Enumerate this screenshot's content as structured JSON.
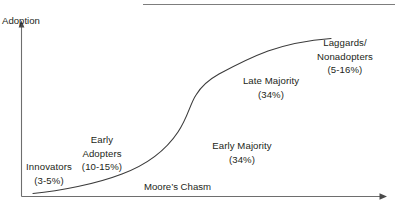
{
  "figure": {
    "type": "diagram",
    "background_color": "#ffffff",
    "line_color": "#3b3b3b",
    "text_color": "#231f20"
  },
  "axes": {
    "y_axis_label": "Adoption",
    "y_axis": {
      "x": 21,
      "top": 22,
      "bottom": 197,
      "arrow": "up"
    },
    "x_axis": {
      "y": 196.5,
      "left": 21,
      "right": 386,
      "arrow": "right"
    }
  },
  "top_rule": {
    "x1": 143,
    "x2": 395,
    "y": 4
  },
  "segments": [
    {
      "id": "innovators",
      "name": "Innovators",
      "share": "(3-5%)",
      "lines": [
        "Innovators",
        "(3-5%)"
      ]
    },
    {
      "id": "early-adopters",
      "name": "Early Adopters",
      "share": "(10-15%)",
      "lines": [
        "Early",
        "Adopters",
        "(10-15%)"
      ]
    },
    {
      "id": "early-majority",
      "name": "Early Majority",
      "share": "(34%)",
      "lines": [
        "Early Majority",
        "(34%)"
      ]
    },
    {
      "id": "late-majority",
      "name": "Late Majority",
      "share": "(34%)",
      "lines": [
        "Late Majority",
        "(34%)"
      ]
    },
    {
      "id": "laggards",
      "name": "Laggards/Nonadopters",
      "share": "(5-16%)",
      "lines": [
        "Laggards/",
        "Nonadopters",
        "(5-16%)"
      ]
    }
  ],
  "annotations": {
    "chasm": "Moore’s Chasm"
  },
  "curve": {
    "description": "S-shaped cumulative adoption curve",
    "path": "M 33 193.5 C 60 191 96 184 122 174 C 146 165 166 150 178 132 C 188 117 190 104 196 95 C 202 85 210 79 219 74 C 232 67 249 58 268 51 C 288 44 312 40 331 38.5"
  }
}
